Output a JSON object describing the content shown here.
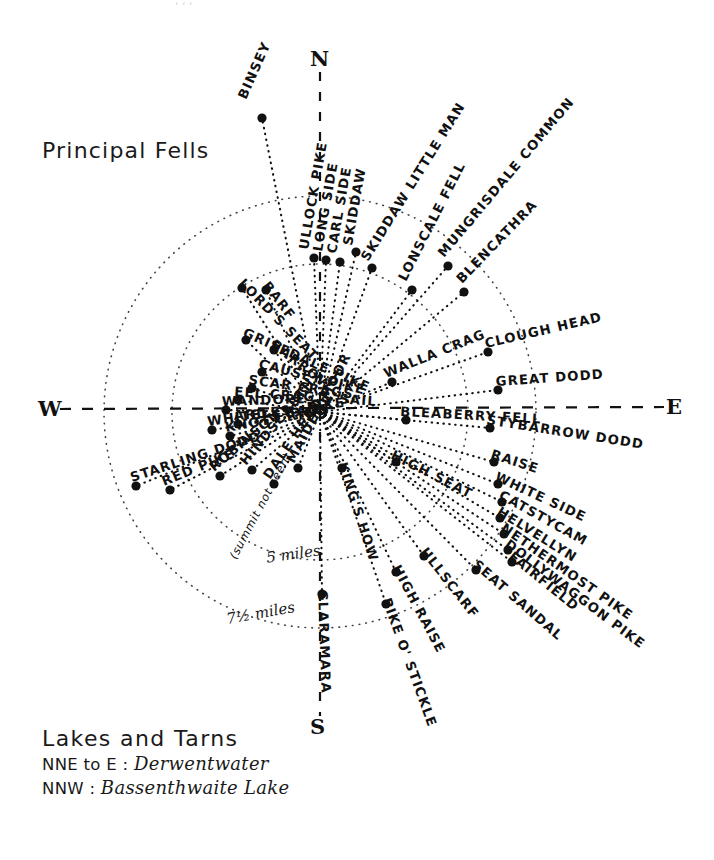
{
  "meta": {
    "title": "Principal Fells",
    "center": {
      "x": 320,
      "y": 412
    },
    "ink": "#111111"
  },
  "cardinals": [
    {
      "label": "N",
      "x": 310,
      "y": 46
    },
    {
      "label": "S",
      "x": 310,
      "y": 714
    },
    {
      "label": "W",
      "x": 38,
      "y": 396
    },
    {
      "label": "E",
      "x": 666,
      "y": 394
    }
  ],
  "scale_rings": [
    {
      "label": "5 miles",
      "radius": 148,
      "x": 266,
      "y": 545
    },
    {
      "label": "7½ miles",
      "radius": 216,
      "x": 226,
      "y": 604
    }
  ],
  "legend": {
    "heading": "Lakes and Tarns",
    "rows": [
      {
        "label": "NNE to E :",
        "value": "Derwentwater"
      },
      {
        "label": "NNW :",
        "value": "Bassenthwaite Lake"
      }
    ]
  },
  "chart_data": {
    "type": "scatter",
    "title": "Principal Fells",
    "axis": "compass bearing (degrees clockwise from North)",
    "radial_axis": "distance in miles",
    "rings": [
      5,
      7.5
    ],
    "points": [
      {
        "name": "BINSEY",
        "bearing": -12,
        "dist": 3.9,
        "label_angle": -66,
        "lx": 262,
        "ly": 118,
        "tx": 246,
        "ty": 100
      },
      {
        "name": "ULLOCK PIKE",
        "bearing": 4,
        "dist": 5.3,
        "label_angle": -80,
        "lx": 314,
        "ly": 258,
        "tx": 308,
        "ty": 250
      },
      {
        "name": "LONG SIDE",
        "bearing": 9,
        "dist": 5.2,
        "label_angle": -80,
        "lx": 326,
        "ly": 260,
        "tx": 322,
        "ty": 252
      },
      {
        "name": "CARL SIDE",
        "bearing": 14,
        "dist": 5.2,
        "label_angle": -80,
        "lx": 340,
        "ly": 262,
        "tx": 336,
        "ty": 254
      },
      {
        "name": "SKIDDAW",
        "bearing": 19,
        "dist": 5.6,
        "label_angle": -80,
        "lx": 356,
        "ly": 252,
        "tx": 352,
        "ty": 246
      },
      {
        "name": "SKIDDAW LITTLE MAN",
        "bearing": 26,
        "dist": 5.4,
        "label_angle": -58,
        "lx": 372,
        "ly": 268,
        "tx": 368,
        "ty": 262
      },
      {
        "name": "LONSCALE FELL",
        "bearing": 38,
        "dist": 5.2,
        "label_angle": -63,
        "lx": 412,
        "ly": 290,
        "tx": 406,
        "ty": 282
      },
      {
        "name": "MUNGRISDALE COMMON",
        "bearing": 48,
        "dist": 6.0,
        "label_angle": -50,
        "lx": 448,
        "ly": 266,
        "tx": 444,
        "ty": 258
      },
      {
        "name": "BLENCATHRA",
        "bearing": 54,
        "dist": 5.6,
        "label_angle": -46,
        "lx": 464,
        "ly": 292,
        "tx": 462,
        "ty": 284
      },
      {
        "name": "WALLA CRAG",
        "bearing": 76,
        "dist": 2.3,
        "label_angle": -22,
        "lx": 392,
        "ly": 382,
        "tx": 386,
        "ty": 378
      },
      {
        "name": "CLOUGH HEAD",
        "bearing": 72,
        "dist": 4.9,
        "label_angle": -13,
        "lx": 488,
        "ly": 352,
        "tx": 486,
        "ty": 348
      },
      {
        "name": "GREAT DODD",
        "bearing": 81,
        "dist": 5.4,
        "label_angle": -4,
        "lx": 498,
        "ly": 390,
        "tx": 496,
        "ty": 386
      },
      {
        "name": "BLEABERRY FELL",
        "bearing": 92,
        "dist": 2.9,
        "label_angle": 3,
        "lx": 406,
        "ly": 420,
        "tx": 400,
        "ty": 416
      },
      {
        "name": "STYBARROW DODD",
        "bearing": 97,
        "dist": 5.2,
        "label_angle": 9,
        "lx": 490,
        "ly": 428,
        "tx": 486,
        "ty": 424
      },
      {
        "name": "RAISE",
        "bearing": 102,
        "dist": 5.3,
        "label_angle": 18,
        "lx": 494,
        "ly": 462,
        "tx": 490,
        "ty": 458
      },
      {
        "name": "HIGH SEAT",
        "bearing": 112,
        "dist": 2.5,
        "label_angle": 27,
        "lx": 396,
        "ly": 462,
        "tx": 390,
        "ty": 458
      },
      {
        "name": "WHITE SIDE",
        "bearing": 106,
        "dist": 5.3,
        "label_angle": 25,
        "lx": 498,
        "ly": 484,
        "tx": 494,
        "ty": 480
      },
      {
        "name": "CATSTYCAM",
        "bearing": 109,
        "dist": 5.4,
        "label_angle": 29,
        "lx": 502,
        "ly": 502,
        "tx": 498,
        "ty": 498
      },
      {
        "name": "HELVELLYN",
        "bearing": 111,
        "dist": 5.4,
        "label_angle": 32,
        "lx": 500,
        "ly": 518,
        "tx": 496,
        "ty": 514
      },
      {
        "name": "NETHERMOST PIKE",
        "bearing": 114,
        "dist": 5.5,
        "label_angle": 35,
        "lx": 504,
        "ly": 534,
        "tx": 500,
        "ty": 530
      },
      {
        "name": "DOLLYWAGGON PIKE",
        "bearing": 116,
        "dist": 5.6,
        "label_angle": 37,
        "lx": 508,
        "ly": 550,
        "tx": 504,
        "ty": 546
      },
      {
        "name": "FAIRFIELD",
        "bearing": 118,
        "dist": 5.8,
        "label_angle": 39,
        "lx": 512,
        "ly": 562,
        "tx": 508,
        "ty": 558
      },
      {
        "name": "SEAT SANDAL",
        "bearing": 120,
        "dist": 5.6,
        "label_angle": 41,
        "lx": 476,
        "ly": 570,
        "tx": 472,
        "ty": 566
      },
      {
        "name": "ULLSCARF",
        "bearing": 136,
        "dist": 3.7,
        "label_angle": 52,
        "lx": 424,
        "ly": 556,
        "tx": 420,
        "ty": 552
      },
      {
        "name": "HIGH RAISE",
        "bearing": 148,
        "dist": 4.3,
        "label_angle": 62,
        "lx": 396,
        "ly": 572,
        "tx": 392,
        "ty": 568
      },
      {
        "name": "PIKE O' STICKLE",
        "bearing": 152,
        "dist": 5.4,
        "label_angle": 70,
        "lx": 386,
        "ly": 604,
        "tx": 382,
        "ty": 600
      },
      {
        "name": "KING'S HOW",
        "bearing": 163,
        "dist": 2.1,
        "label_angle": 72,
        "lx": 342,
        "ly": 468,
        "tx": 338,
        "ty": 464
      },
      {
        "name": "GLARAMARA",
        "bearing": 178,
        "dist": 5.2,
        "label_angle": 88,
        "lx": 322,
        "ly": 594,
        "tx": 318,
        "ty": 590
      },
      {
        "name": "MAIDEN MOOR",
        "bearing": 202,
        "dist": 2.6,
        "label_angle": -62,
        "lx": 298,
        "ly": 468,
        "tx": 294,
        "ty": 464
      },
      {
        "name": "DALE HEAD",
        "bearing": 210,
        "dist": 3.5,
        "label_angle": -56,
        "lx": 274,
        "ly": 484,
        "tx": 270,
        "ty": 480
      },
      {
        "name": "HINDSCARTH",
        "bearing": 216,
        "dist": 3.4,
        "label_angle": -50,
        "lx": 252,
        "ly": 470,
        "tx": 246,
        "ty": 466
      },
      {
        "name": "ROBINSON",
        "bearing": 224,
        "dist": 3.4,
        "label_angle": -40,
        "lx": 220,
        "ly": 476,
        "tx": 214,
        "ty": 472
      },
      {
        "name": "RED PIKE",
        "bearing": 243,
        "dist": 3.6,
        "label_angle": -22,
        "lx": 170,
        "ly": 490,
        "tx": 164,
        "ty": 486
      },
      {
        "name": "STARLING DODD",
        "bearing": 248,
        "dist": 4.2,
        "label_angle": -18,
        "lx": 136,
        "ly": 486,
        "tx": 132,
        "ty": 482
      },
      {
        "name": "KNOTT RIGG",
        "bearing": 254,
        "dist": 2.3,
        "label_angle": -10,
        "lx": 230,
        "ly": 436,
        "tx": 226,
        "ty": 432
      },
      {
        "name": "WHITELESS PIKE",
        "bearing": 256,
        "dist": 2.9,
        "label_angle": -8,
        "lx": 212,
        "ly": 430,
        "tx": 208,
        "ty": 426
      },
      {
        "name": "ARD CRAGS",
        "bearing": 262,
        "dist": 2.7,
        "label_angle": -4,
        "lx": 238,
        "ly": 424,
        "tx": 234,
        "ty": 420
      },
      {
        "name": "WANDOPE",
        "bearing": 266,
        "dist": 3.1,
        "label_angle": -2,
        "lx": 226,
        "ly": 410,
        "tx": 222,
        "ty": 406
      },
      {
        "name": "EEL CRAG & SAIL",
        "bearing": 271,
        "dist": 3.2,
        "label_angle": 4,
        "lx": 238,
        "ly": 400,
        "tx": 234,
        "ty": 396
      },
      {
        "name": "SCAR CRAGS",
        "bearing": 276,
        "dist": 3.2,
        "label_angle": 8,
        "lx": 252,
        "ly": 388,
        "tx": 248,
        "ty": 384
      },
      {
        "name": "CAUSEY PIKE",
        "bearing": 281,
        "dist": 2.9,
        "label_angle": 14,
        "lx": 262,
        "ly": 372,
        "tx": 258,
        "ty": 368
      },
      {
        "name": "GRISEDALE PIKE",
        "bearing": 288,
        "dist": 4.0,
        "label_angle": 24,
        "lx": 246,
        "ly": 340,
        "tx": 242,
        "ty": 336
      },
      {
        "name": "BARROW",
        "bearing": 294,
        "dist": 2.5,
        "label_angle": 38,
        "lx": 274,
        "ly": 350,
        "tx": 270,
        "ty": 346
      },
      {
        "name": "LORD'S SEAT",
        "bearing": 302,
        "dist": 4.6,
        "label_angle": 46,
        "lx": 242,
        "ly": 288,
        "tx": 238,
        "ty": 284
      },
      {
        "name": "BARF",
        "bearing": 310,
        "dist": 4.1,
        "label_angle": 52,
        "lx": 266,
        "ly": 290,
        "tx": 262,
        "ty": 286
      }
    ]
  },
  "annotations": [
    {
      "text": "(summit not seen)",
      "x": 236,
      "y": 560,
      "rot": -62
    }
  ]
}
